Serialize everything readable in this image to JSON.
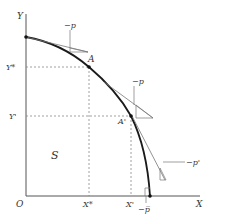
{
  "diagram": {
    "type": "production-possibility-frontier",
    "axes": {
      "x_label": "X",
      "y_label": "Y",
      "origin_label": "O"
    },
    "points": {
      "A": {
        "label": "A",
        "x_label": "X*",
        "y_label": "Y*"
      },
      "A_prime": {
        "label": "A'",
        "x_label": "X'",
        "y_label": "Y'"
      }
    },
    "region_label": "S",
    "price_labels": {
      "top": "−p",
      "middle": "−p",
      "lower_right": "−p'",
      "bottom": "−p̅"
    },
    "colors": {
      "curve": "#1a1a1a",
      "axis": "#555555",
      "tangent": "#777777",
      "dashed": "#888888",
      "text": "#333333"
    }
  }
}
